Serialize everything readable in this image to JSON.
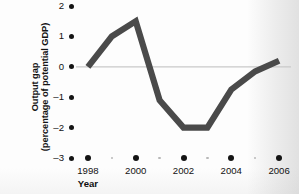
{
  "chart_data": {
    "type": "line",
    "title": "",
    "xlabel": "Year",
    "ylabel_line1": "Output gap",
    "ylabel_line2": "(percentage of potential GDP)",
    "ylabel": "Output gap (percentage of potential GDP)",
    "x": [
      1998,
      1999,
      2000,
      2001,
      2002,
      2003,
      2004,
      2005,
      2006
    ],
    "values": [
      0.0,
      1.0,
      1.5,
      -1.1,
      -2.0,
      -2.0,
      -0.75,
      -0.15,
      0.2
    ],
    "series": [
      {
        "name": "Output gap",
        "values": [
          0.0,
          1.0,
          1.5,
          -1.1,
          -2.0,
          -2.0,
          -0.75,
          -0.15,
          0.2
        ]
      }
    ],
    "xlim": [
      1997.5,
      2006.5
    ],
    "ylim": [
      -3,
      2
    ],
    "yticks": [
      2,
      1,
      0,
      -1,
      -2,
      -3
    ],
    "ytick_labels": [
      "2",
      "1",
      "0",
      "–1",
      "–2",
      "–3"
    ],
    "xticks_major": [
      1998,
      2000,
      2002,
      2004,
      2006
    ],
    "xtick_labels": [
      "1998",
      "2000",
      "2002",
      "2004",
      "2006"
    ],
    "xticks_minor": [
      1999,
      2001,
      2003,
      2005
    ],
    "grid": false,
    "zero_line": true,
    "legend": "none",
    "line_color": "#4a4a4a",
    "zero_line_color": "#c9c9c9",
    "tick_color": "#141414",
    "minor_tick_color": "#b8b8b8"
  }
}
